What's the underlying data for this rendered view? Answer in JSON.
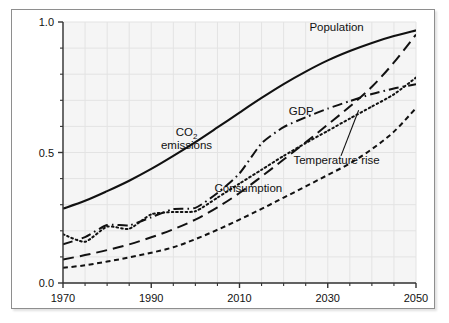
{
  "chart_data": {
    "type": "line",
    "title": "",
    "subtitle": "",
    "xlabel": "",
    "ylabel": "",
    "xlim": [
      1970,
      2050
    ],
    "ylim": [
      0.0,
      1.0
    ],
    "grid": true,
    "legend_position": "inline-annotations",
    "x_tick_labels": [
      "1970",
      "1990",
      "2010",
      "2030",
      "2050"
    ],
    "x_tick_values": [
      1970,
      1990,
      2010,
      2030,
      2050
    ],
    "x_minor_tick_values": [
      1975,
      1980,
      1985,
      1995,
      2000,
      2005,
      2015,
      2020,
      2025,
      2035,
      2040,
      2045
    ],
    "y_tick_labels": [
      "0.0",
      "0.5",
      "1.0"
    ],
    "y_tick_values": [
      0.0,
      0.5,
      1.0
    ],
    "y_minor_tick_values": [
      0.1,
      0.2,
      0.3,
      0.4,
      0.6,
      0.7,
      0.8,
      0.9
    ],
    "x": [
      1970,
      1975,
      1980,
      1985,
      1990,
      1995,
      2000,
      2005,
      2010,
      2015,
      2020,
      2025,
      2030,
      2035,
      2040,
      2045,
      2050
    ],
    "series": [
      {
        "name": "Population",
        "style": "solid",
        "label": "Population",
        "label_x": 2032,
        "label_y": 0.965,
        "values": [
          0.285,
          0.315,
          0.352,
          0.392,
          0.437,
          0.487,
          0.54,
          0.596,
          0.653,
          0.709,
          0.762,
          0.81,
          0.853,
          0.889,
          0.92,
          0.946,
          0.968
        ]
      },
      {
        "name": "GDP",
        "style": "long-dash",
        "label": "GDP",
        "label_x": 2024,
        "label_y": 0.645,
        "values": [
          0.09,
          0.107,
          0.126,
          0.148,
          0.175,
          0.206,
          0.243,
          0.29,
          0.345,
          0.408,
          0.473,
          0.539,
          0.607,
          0.676,
          0.752,
          0.845,
          0.952
        ]
      },
      {
        "name": "CO2 emissions",
        "style": "dash-dot",
        "label_line1": "CO",
        "label_sub": "2",
        "label_line2": "emissions",
        "label_x": 1998,
        "label_y": 0.565,
        "values": [
          0.148,
          0.176,
          0.222,
          0.221,
          0.252,
          0.283,
          0.288,
          0.345,
          0.42,
          0.535,
          0.597,
          0.635,
          0.668,
          0.697,
          0.724,
          0.745,
          0.762
        ]
      },
      {
        "name": "Temperature rise",
        "style": "dotted",
        "label": "Temperature rise",
        "label_x": 2032,
        "label_y": 0.455,
        "leader_from_x": 2033,
        "leader_from_y": 0.487,
        "leader_to_x": 2037,
        "leader_to_y": 0.662,
        "values": [
          0.187,
          0.158,
          0.216,
          0.208,
          0.263,
          0.272,
          0.275,
          0.327,
          0.381,
          0.434,
          0.487,
          0.536,
          0.583,
          0.63,
          0.676,
          0.723,
          0.787
        ]
      },
      {
        "name": "Consumption",
        "style": "short-dash",
        "label": "Consumption",
        "label_x": 2012,
        "label_y": 0.348,
        "values": [
          0.058,
          0.068,
          0.082,
          0.098,
          0.116,
          0.137,
          0.168,
          0.204,
          0.243,
          0.284,
          0.327,
          0.37,
          0.414,
          0.458,
          0.513,
          0.58,
          0.67
        ]
      }
    ]
  },
  "colors": {
    "line": "#111111",
    "axis": "#333333",
    "grid": "#e3e3e3",
    "plot_background": "#f5f5f5",
    "frame_border": "#8e8e8e",
    "page_background": "#ffffff"
  }
}
